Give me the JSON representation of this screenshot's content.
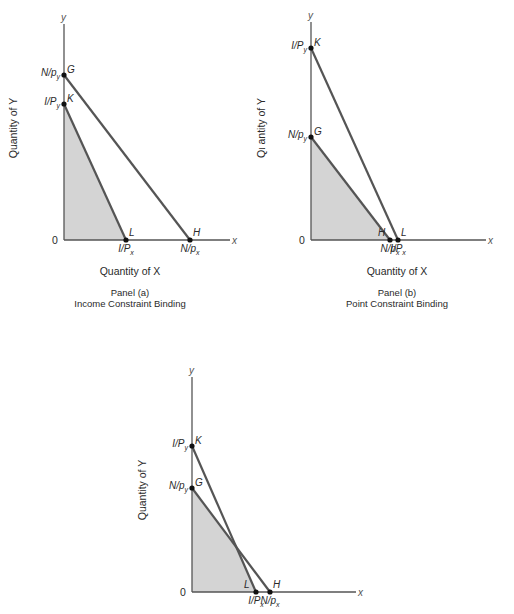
{
  "figure": {
    "background": "#ffffff",
    "line_color": "#555555",
    "shade_color": "#d4d4d4",
    "point_color": "#111111"
  },
  "panels": [
    {
      "id": "a",
      "caption_line1": "Panel (a)",
      "caption_line2": "Income Constraint Binding",
      "x_axis_title": "Quantity of X",
      "y_axis_title": "Quantity of Y",
      "axis_x_symbol": "x",
      "axis_y_symbol": "y",
      "origin_label": "0",
      "geometry": {
        "origin": [
          64,
          240
        ],
        "x_end": 230,
        "y_top": 24,
        "caption_center_x": 130,
        "x_title_y": 275,
        "caption1_y": 296,
        "caption2_y": 307,
        "y_title_x": 17,
        "y_title_center_y": 128
      },
      "points": [
        {
          "name": "G",
          "axis": "y",
          "pos": [
            64,
            75
          ],
          "tick_main": "N/p",
          "tick_sub": "y"
        },
        {
          "name": "K",
          "axis": "y",
          "pos": [
            64,
            104
          ],
          "tick_main": "I/P",
          "tick_sub": "y"
        },
        {
          "name": "L",
          "axis": "x",
          "pos": [
            126,
            240
          ],
          "tick_main": "I/P",
          "tick_sub": "x"
        },
        {
          "name": "H",
          "axis": "x",
          "pos": [
            190,
            240
          ],
          "tick_main": "N/p",
          "tick_sub": "x"
        }
      ],
      "lines": [
        {
          "name": "income-constraint",
          "from": "K",
          "to": "L"
        },
        {
          "name": "point-constraint",
          "from": "G",
          "to": "H"
        }
      ],
      "shaded_region": [
        "origin",
        "K",
        "L"
      ]
    },
    {
      "id": "b",
      "caption_line1": "Panel (b)",
      "caption_line2": "Point Constraint Binding",
      "x_axis_title": "Quantity of X",
      "y_axis_title": "Qι antity of Y",
      "axis_x_symbol": "x",
      "axis_y_symbol": "y",
      "origin_label": "0",
      "geometry": {
        "origin": [
          311,
          240
        ],
        "x_end": 486,
        "y_top": 22,
        "caption_center_x": 397,
        "x_title_y": 275,
        "caption1_y": 296,
        "caption2_y": 307,
        "y_title_x": 265,
        "y_title_center_y": 128
      },
      "points": [
        {
          "name": "K",
          "axis": "y",
          "pos": [
            311,
            48
          ],
          "tick_main": "I/P",
          "tick_sub": "y"
        },
        {
          "name": "G",
          "axis": "y",
          "pos": [
            311,
            137
          ],
          "tick_main": "N/p",
          "tick_sub": "y"
        },
        {
          "name": "H",
          "axis": "x",
          "pos": [
            390,
            240
          ],
          "tick_main": "N/p",
          "tick_sub": "x"
        },
        {
          "name": "L",
          "axis": "x",
          "pos": [
            398,
            240
          ],
          "tick_main": "I/P",
          "tick_sub": "x"
        }
      ],
      "lines": [
        {
          "name": "income-constraint",
          "from": "K",
          "to": "L"
        },
        {
          "name": "point-constraint",
          "from": "G",
          "to": "H"
        }
      ],
      "shaded_region": [
        "origin",
        "G",
        "H"
      ]
    },
    {
      "id": "c",
      "caption_line1": "",
      "caption_line2": "",
      "x_axis_title": "",
      "y_axis_title": "Quantity of Y",
      "axis_x_symbol": "x",
      "axis_y_symbol": "y",
      "origin_label": "0",
      "geometry": {
        "origin": [
          192,
          592
        ],
        "x_end": 356,
        "y_top": 377,
        "caption_center_x": 270,
        "x_title_y": 630,
        "caption1_y": 640,
        "caption2_y": 650,
        "y_title_x": 146,
        "y_title_center_y": 490
      },
      "points": [
        {
          "name": "K",
          "axis": "y",
          "pos": [
            192,
            446
          ],
          "tick_main": "I/P",
          "tick_sub": "y"
        },
        {
          "name": "G",
          "axis": "y",
          "pos": [
            192,
            488
          ],
          "tick_main": "N/p",
          "tick_sub": "y"
        },
        {
          "name": "L",
          "axis": "x",
          "pos": [
            256,
            592
          ],
          "tick_main": "I/P",
          "tick_sub": "x"
        },
        {
          "name": "H",
          "axis": "x",
          "pos": [
            270,
            592
          ],
          "tick_main": "N/p",
          "tick_sub": "x"
        }
      ],
      "lines": [
        {
          "name": "income-constraint",
          "from": "K",
          "to": "L"
        },
        {
          "name": "point-constraint",
          "from": "G",
          "to": "H"
        }
      ],
      "shaded_region": [
        "origin",
        "G",
        "intersection",
        "L"
      ]
    }
  ]
}
